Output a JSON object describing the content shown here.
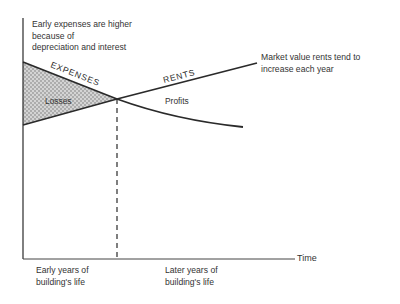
{
  "annotations": {
    "early_expenses": [
      "Early expenses are higher",
      "because of",
      "depreciation and interest"
    ],
    "market_rents": [
      "Market value rents tend to",
      "increase each year"
    ]
  },
  "lines": {
    "expenses_label": "EXPENSES",
    "rents_label": "RENTS"
  },
  "regions": {
    "losses_label": "Losses",
    "profits_label": "Profits"
  },
  "axis": {
    "x_label": "Time",
    "early_years": [
      "Early years of",
      "building's life"
    ],
    "later_years": [
      "Later years of",
      "building's life"
    ]
  },
  "colors": {
    "line": "#2a2a2a",
    "hatch": "#b0b0b0"
  }
}
